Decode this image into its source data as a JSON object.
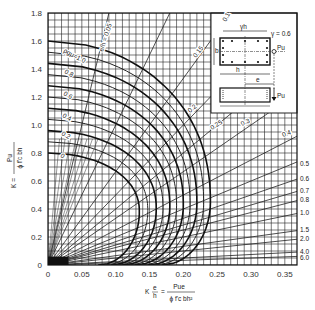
{
  "chart_data": {
    "type": "line",
    "xlabel": "K e/h = Pu e / (phi f'c b h^2)",
    "ylabel": "K = Pu / (phi f'c b h)",
    "xlim": [
      0,
      0.368
    ],
    "ylim": [
      0,
      1.8
    ],
    "grid": true,
    "x_ticks": [
      "0",
      "0.05",
      "0.10",
      "0.15",
      "0.20",
      "0.25",
      "0.30",
      "0.35"
    ],
    "x_tick_values": [
      0,
      0.05,
      0.1,
      0.15,
      0.2,
      0.25,
      0.3,
      0.35
    ],
    "y_ticks": [
      "0",
      "0.2",
      "0.4",
      "0.6",
      "0.8",
      "1.0",
      "1.2",
      "1.4",
      "1.6",
      "1.8"
    ],
    "y_tick_values": [
      0,
      0.2,
      0.4,
      0.6,
      0.8,
      1.0,
      1.2,
      1.4,
      1.6,
      1.8
    ],
    "gamma_label": "γ = 0.6",
    "rho_curves": {
      "label_prefix": "ρgμ=",
      "series": [
        {
          "name": "0",
          "p0": 0.8,
          "peak_x": 0.135,
          "peak_y": 0.38
        },
        {
          "name": "0.2",
          "p0": 0.96,
          "peak_x": 0.16,
          "peak_y": 0.4
        },
        {
          "name": "0.4",
          "p0": 1.12,
          "peak_x": 0.18,
          "peak_y": 0.42
        },
        {
          "name": "0.6",
          "p0": 1.28,
          "peak_x": 0.2,
          "peak_y": 0.43
        },
        {
          "name": "0.8",
          "p0": 1.44,
          "peak_x": 0.22,
          "peak_y": 0.44
        },
        {
          "name": "1.0",
          "p0": 1.6,
          "peak_x": 0.24,
          "peak_y": 0.45
        }
      ],
      "visible_labels": [
        "ρgμ=1.0",
        "0.8",
        "0.6",
        "0.4",
        "0.2",
        "0"
      ]
    },
    "eccentricity_lines": {
      "label_prefix": "e/h =",
      "values": [
        0.05,
        0.1,
        0.15,
        0.2,
        0.25,
        0.3,
        0.4,
        0.5,
        0.6,
        0.7,
        0.8,
        1.0,
        1.5,
        2.0,
        4.0,
        6.0
      ],
      "labels": [
        "e/h = 0.05",
        "0.1",
        "0.15",
        "0.2",
        "0.25",
        "0.3",
        "0.4",
        "0.5",
        "0.6",
        "0.7",
        "0.8",
        "1.0",
        "1.5",
        "2.0",
        "4.0",
        "6.0"
      ]
    },
    "inset": {
      "labels": [
        "γh",
        "γ = 0.6",
        "b",
        "h",
        "e",
        "Pu",
        "Pu"
      ]
    }
  }
}
